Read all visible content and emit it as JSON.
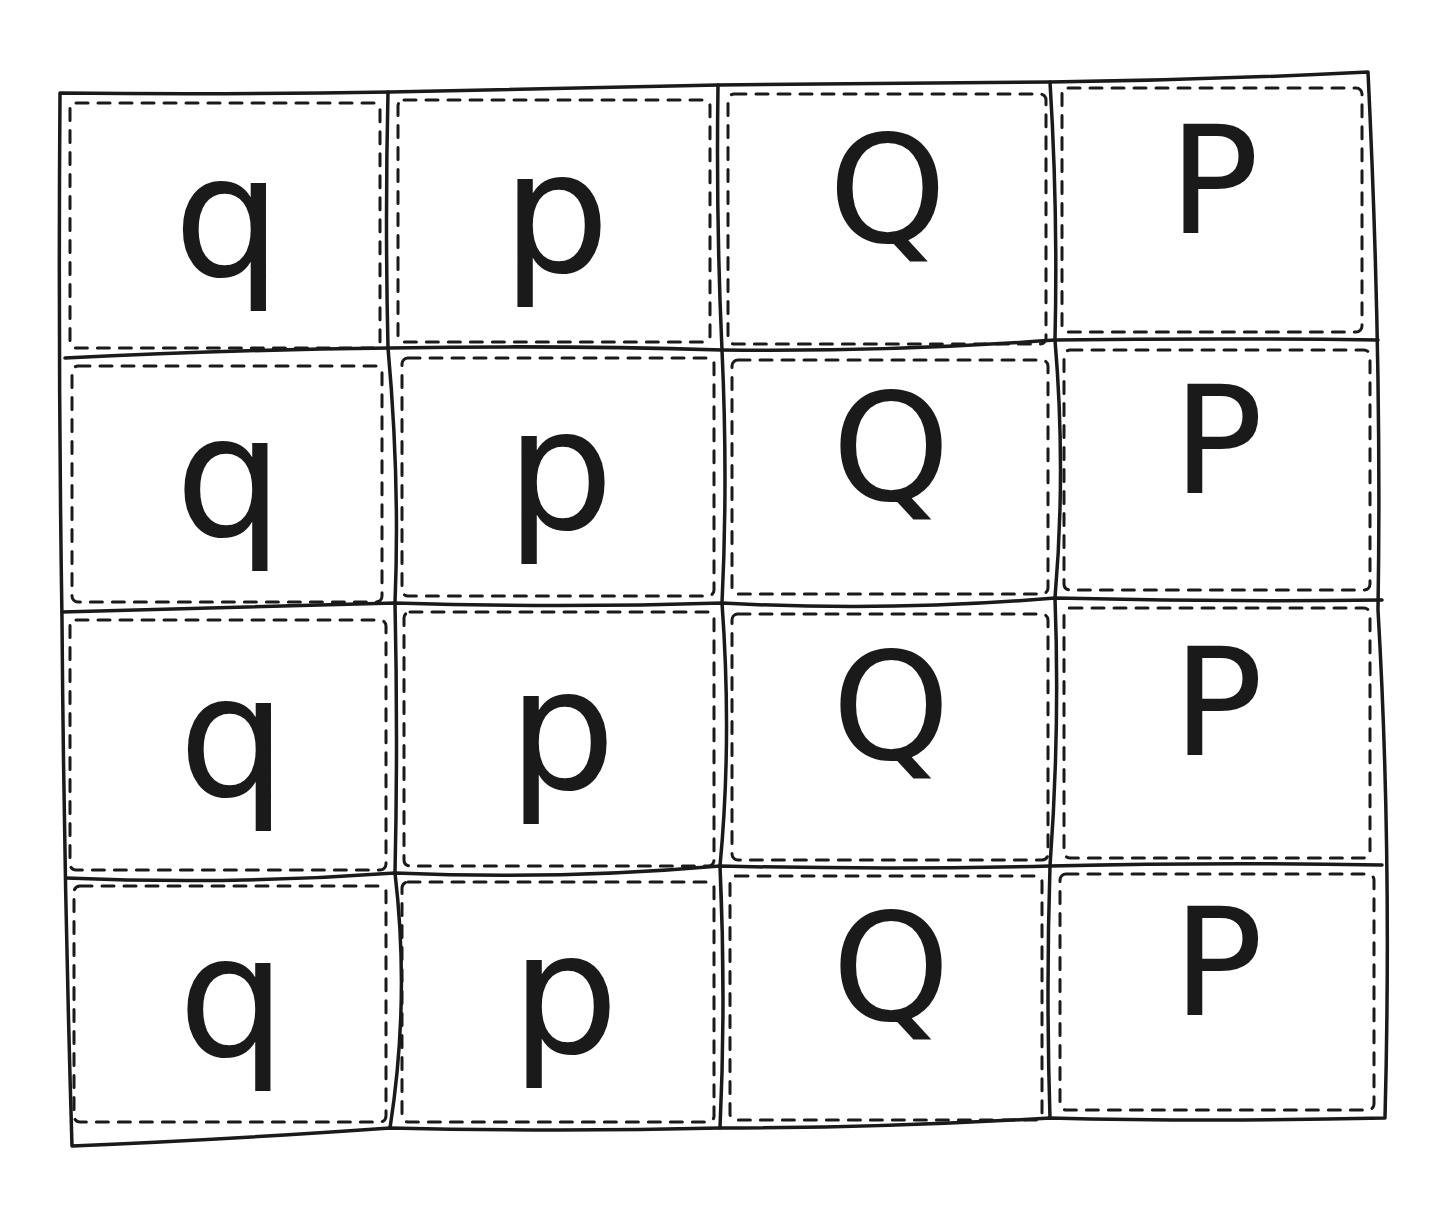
{
  "worksheet": {
    "rows": [
      {
        "cells": [
          "q",
          "p",
          "Q",
          "P"
        ]
      },
      {
        "cells": [
          "q",
          "p",
          "Q",
          "P"
        ]
      },
      {
        "cells": [
          "q",
          "p",
          "Q",
          "P"
        ]
      },
      {
        "cells": [
          "q",
          "p",
          "Q",
          "P"
        ]
      }
    ],
    "colors": {
      "ink": "#1a1a1a",
      "paper": "#ffffff"
    }
  }
}
